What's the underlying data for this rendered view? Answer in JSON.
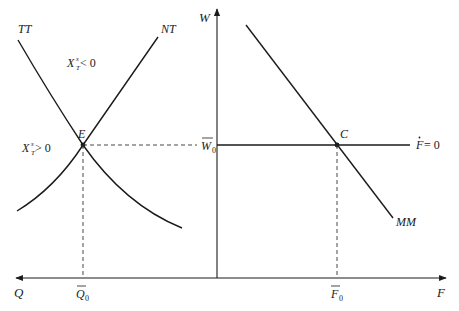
{
  "diagram": {
    "left_panel": {
      "curves": {
        "tt_label": "TT",
        "nt_label": "NT"
      },
      "regions": {
        "upper_label_base": "X",
        "upper_label_sup": "s",
        "upper_label_sub": "T",
        "upper_label_rel": " < 0",
        "lower_label_base": "X",
        "lower_label_sup": "s",
        "lower_label_sub": "T",
        "lower_label_rel": " > 0"
      },
      "equilibrium_label": "E",
      "x_axis_label": "Q",
      "x_tick_label": "Q",
      "x_tick_sub": "0"
    },
    "shared": {
      "y_axis_label": "W",
      "y_tick_label": "W",
      "y_tick_sub": "0"
    },
    "right_panel": {
      "curves": {
        "mm_label": "MM",
        "fdot_label": "F",
        "fdot_rel": " = 0"
      },
      "equilibrium_label": "C",
      "x_axis_label": "F",
      "x_tick_label": "F",
      "x_tick_sub": "0"
    }
  },
  "colors": {
    "line": "#1a1a1a",
    "background": "#ffffff"
  }
}
